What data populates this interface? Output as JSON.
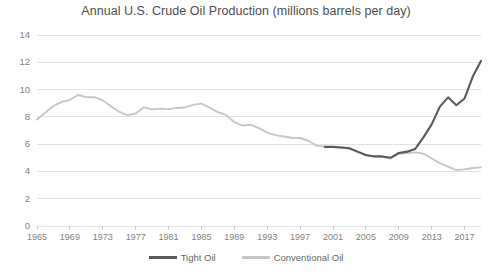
{
  "chart_data": {
    "type": "line",
    "title": "Annual U.S. Crude Oil Production (millions barrels per day)",
    "xlabel": "",
    "ylabel": "",
    "xlim": [
      1965,
      2019
    ],
    "ylim": [
      0,
      14
    ],
    "grid": true,
    "legend_position": "bottom",
    "y_ticks": [
      0,
      2,
      4,
      6,
      8,
      10,
      12,
      14
    ],
    "x_ticks": [
      1965,
      1969,
      1973,
      1977,
      1981,
      1985,
      1989,
      1993,
      1997,
      2001,
      2005,
      2009,
      2013,
      2017
    ],
    "x": [
      1965,
      1966,
      1967,
      1968,
      1969,
      1970,
      1971,
      1972,
      1973,
      1974,
      1975,
      1976,
      1977,
      1978,
      1979,
      1980,
      1981,
      1982,
      1983,
      1984,
      1985,
      1986,
      1987,
      1988,
      1989,
      1990,
      1991,
      1992,
      1993,
      1994,
      1995,
      1996,
      1997,
      1998,
      1999,
      2000,
      2001,
      2002,
      2003,
      2004,
      2005,
      2006,
      2007,
      2008,
      2009,
      2010,
      2011,
      2012,
      2013,
      2014,
      2015,
      2016,
      2017,
      2018,
      2019
    ],
    "series": [
      {
        "name": "Tight Oil",
        "color": "#595959",
        "values": [
          null,
          null,
          null,
          null,
          null,
          null,
          null,
          null,
          null,
          null,
          null,
          null,
          null,
          null,
          null,
          null,
          null,
          null,
          null,
          null,
          null,
          null,
          null,
          null,
          null,
          null,
          null,
          null,
          null,
          null,
          null,
          null,
          null,
          null,
          null,
          5.8,
          5.8,
          5.75,
          5.7,
          5.45,
          5.2,
          5.1,
          5.1,
          5.0,
          5.35,
          5.45,
          5.65,
          6.5,
          7.45,
          8.75,
          9.43,
          8.85,
          9.35,
          10.95,
          12.1
        ]
      },
      {
        "name": "Conventional Oil",
        "color": "#c6c6c6",
        "values": [
          7.8,
          8.3,
          8.8,
          9.1,
          9.25,
          9.6,
          9.45,
          9.44,
          9.2,
          8.77,
          8.37,
          8.13,
          8.25,
          8.7,
          8.55,
          8.6,
          8.57,
          8.65,
          8.69,
          8.88,
          8.97,
          8.68,
          8.35,
          8.14,
          7.61,
          7.36,
          7.42,
          7.17,
          6.85,
          6.66,
          6.56,
          6.47,
          6.45,
          6.25,
          5.88,
          5.82,
          5.8,
          5.75,
          5.68,
          5.42,
          5.18,
          5.1,
          5.07,
          4.95,
          5.3,
          5.35,
          5.4,
          5.3,
          4.95,
          4.6,
          4.35,
          4.1,
          4.15,
          4.25,
          4.3
        ]
      }
    ]
  },
  "legend": {
    "items": [
      {
        "label": "Tight Oil",
        "color": "#595959"
      },
      {
        "label": "Conventional Oil",
        "color": "#c6c6c6"
      }
    ]
  }
}
